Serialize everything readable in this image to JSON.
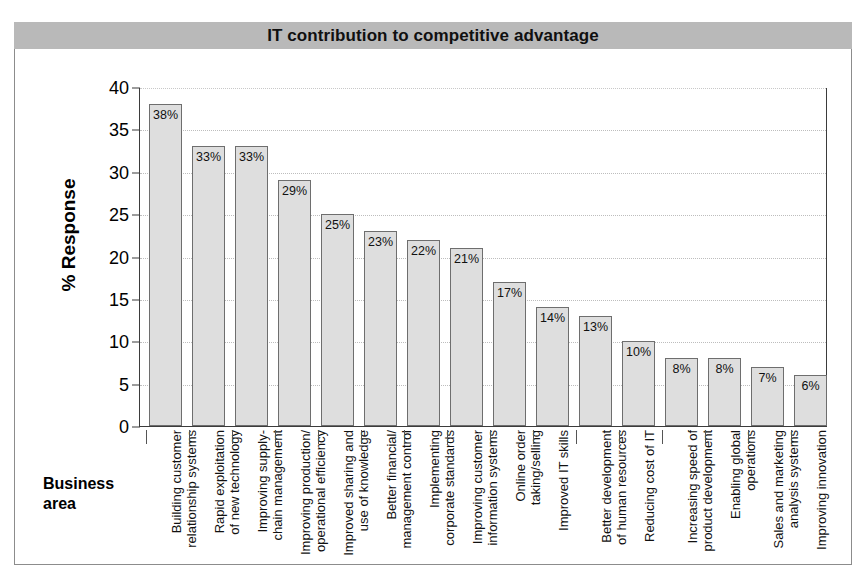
{
  "chart": {
    "title": "IT contribution to competitive advantage",
    "y_axis_title": "% Response",
    "x_axis_title_line1": "Business",
    "x_axis_title_line2": "area"
  },
  "chart_data": {
    "type": "bar",
    "title": "IT contribution to competitive advantage",
    "xlabel": "Business area",
    "ylabel": "% Response",
    "ylim": [
      0,
      40
    ],
    "yticks": [
      0,
      5,
      10,
      15,
      20,
      25,
      30,
      35,
      40
    ],
    "grid": true,
    "legend": "none",
    "bar_color": "#dedede",
    "bar_edge_color": "#6e6e6e",
    "categories": [
      "Building customer relationship systems",
      "Rapid exploitation of new technology",
      "Improving supply-chain management",
      "Improving production/ operational efficiency",
      "Improved sharing and use of knowledge",
      "Better financial/ management control",
      "Implementing corporate standards",
      "Improving customer information systems",
      "Online order taking/selling",
      "Improved IT skills",
      "Better development of human resources",
      "Reducing cost of IT",
      "Increasing speed of product development",
      "Enabling global operations",
      "Sales and marketing analysis systems",
      "Improving innovation"
    ],
    "category_lines": [
      [
        "Building customer",
        "relationship systems"
      ],
      [
        "Rapid exploitation",
        "of new technology"
      ],
      [
        "Improving supply-",
        "chain management"
      ],
      [
        "Improving production/",
        "operational efficiency"
      ],
      [
        "Improved sharing and",
        "use of knowledge"
      ],
      [
        "Better financial/",
        "management control"
      ],
      [
        "Implementing",
        "corporate standards"
      ],
      [
        "Improving customer",
        "information systems"
      ],
      [
        "Online order",
        "taking/selling"
      ],
      [
        "Improved IT skills"
      ],
      [
        "Better development",
        "of human resources"
      ],
      [
        "Reducing cost of IT"
      ],
      [
        "Increasing speed of",
        "product development"
      ],
      [
        "Enabling global",
        "operations"
      ],
      [
        "Sales and marketing",
        "analysis systems"
      ],
      [
        "Improving innovation"
      ]
    ],
    "values": [
      38,
      33,
      33,
      29,
      25,
      23,
      22,
      21,
      17,
      14,
      13,
      10,
      8,
      8,
      7,
      6
    ],
    "value_labels": [
      "38%",
      "33%",
      "33%",
      "29%",
      "25%",
      "23%",
      "22%",
      "21%",
      "17%",
      "14%",
      "13%",
      "10%",
      "8%",
      "8%",
      "7%",
      "6%"
    ]
  }
}
